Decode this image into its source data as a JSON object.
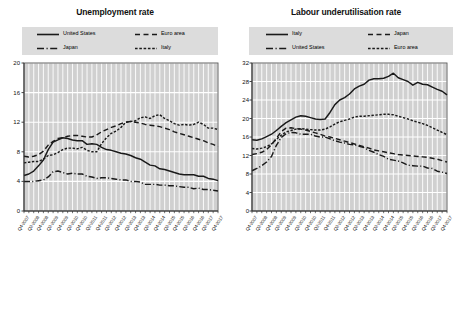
{
  "chart_data": [
    {
      "type": "line",
      "title": "Unemployment rate",
      "xlabel": "",
      "ylabel": "",
      "ylim": [
        0,
        20
      ],
      "yticks": [
        0,
        4,
        8,
        12,
        16,
        20
      ],
      "grid": true,
      "legend_position": "top",
      "x": [
        "Q4-2007",
        "Q2-2008",
        "Q4-2008",
        "Q2-2009",
        "Q4-2009",
        "Q2-2010",
        "Q4-2010",
        "Q2-2011",
        "Q4-2011",
        "Q2-2012",
        "Q4-2012",
        "Q2-2013",
        "Q4-2013",
        "Q2-2014",
        "Q4-2014",
        "Q2-2015",
        "Q4-2015",
        "Q2-2016",
        "Q4-2016",
        "Q2-2017",
        "Q4-2017"
      ],
      "x_all": [
        "Q4-2007",
        "Q1-2008",
        "Q2-2008",
        "Q3-2008",
        "Q4-2008",
        "Q1-2009",
        "Q2-2009",
        "Q3-2009",
        "Q4-2009",
        "Q1-2010",
        "Q2-2010",
        "Q3-2010",
        "Q4-2010",
        "Q1-2011",
        "Q2-2011",
        "Q3-2011",
        "Q4-2011",
        "Q1-2012",
        "Q2-2012",
        "Q3-2012",
        "Q4-2012",
        "Q1-2013",
        "Q2-2013",
        "Q3-2013",
        "Q4-2013",
        "Q1-2014",
        "Q2-2014",
        "Q3-2014",
        "Q4-2014",
        "Q1-2015",
        "Q2-2015",
        "Q3-2015",
        "Q4-2015",
        "Q1-2016",
        "Q2-2016",
        "Q3-2016",
        "Q4-2016",
        "Q1-2017",
        "Q2-2017",
        "Q3-2017",
        "Q4-2017"
      ],
      "series": [
        {
          "name": "United States",
          "style": "solid",
          "values": [
            4.8,
            5.0,
            5.4,
            6.1,
            6.9,
            8.3,
            9.3,
            9.6,
            9.9,
            9.8,
            9.6,
            9.5,
            9.5,
            9.0,
            9.1,
            9.0,
            8.6,
            8.3,
            8.2,
            8.0,
            7.8,
            7.7,
            7.5,
            7.2,
            7.0,
            6.6,
            6.2,
            6.1,
            5.7,
            5.6,
            5.4,
            5.2,
            5.0,
            4.9,
            4.9,
            4.9,
            4.7,
            4.7,
            4.4,
            4.3,
            4.1
          ]
        },
        {
          "name": "Euro area",
          "style": "dashed-long",
          "values": [
            7.4,
            7.3,
            7.4,
            7.6,
            8.1,
            8.9,
            9.4,
            9.8,
            9.9,
            10.1,
            10.2,
            10.2,
            10.1,
            10.0,
            10.0,
            10.3,
            10.7,
            11.0,
            11.3,
            11.5,
            11.8,
            12.0,
            12.1,
            12.0,
            11.9,
            11.7,
            11.6,
            11.5,
            11.4,
            11.2,
            11.0,
            10.7,
            10.5,
            10.3,
            10.1,
            9.9,
            9.7,
            9.5,
            9.2,
            9.0,
            8.7
          ]
        },
        {
          "name": "Japan",
          "style": "dash-dot",
          "values": [
            4.0,
            4.0,
            4.0,
            4.1,
            4.2,
            4.6,
            5.3,
            5.4,
            5.2,
            5.0,
            5.1,
            5.0,
            5.0,
            4.7,
            4.6,
            4.4,
            4.5,
            4.5,
            4.4,
            4.3,
            4.2,
            4.2,
            4.0,
            4.0,
            3.9,
            3.6,
            3.6,
            3.6,
            3.5,
            3.5,
            3.4,
            3.4,
            3.3,
            3.2,
            3.2,
            3.0,
            3.1,
            2.9,
            2.9,
            2.8,
            2.7
          ]
        },
        {
          "name": "Italy",
          "style": "dashed-short",
          "values": [
            6.5,
            6.6,
            6.7,
            6.7,
            7.0,
            7.5,
            7.6,
            7.9,
            8.3,
            8.5,
            8.5,
            8.4,
            8.6,
            8.2,
            8.0,
            8.0,
            9.1,
            9.9,
            10.5,
            10.8,
            11.3,
            12.0,
            12.1,
            12.2,
            12.6,
            12.7,
            12.5,
            12.9,
            13.0,
            12.5,
            12.2,
            11.8,
            11.6,
            11.7,
            11.6,
            11.7,
            12.0,
            11.7,
            11.2,
            11.2,
            11.0
          ]
        }
      ]
    },
    {
      "type": "line",
      "title": "Labour underutilisation rate",
      "xlabel": "",
      "ylabel": "",
      "ylim": [
        0,
        32
      ],
      "yticks": [
        0,
        4,
        8,
        12,
        16,
        20,
        24,
        28,
        32
      ],
      "grid": true,
      "legend_position": "top",
      "x": [
        "Q4-2007",
        "Q2-2008",
        "Q4-2008",
        "Q2-2009",
        "Q4-2009",
        "Q2-2010",
        "Q4-2010",
        "Q2-2011",
        "Q4-2011",
        "Q2-2012",
        "Q4-2012",
        "Q2-2013",
        "Q4-2013",
        "Q2-2014",
        "Q4-2014",
        "Q2-2015",
        "Q4-2015",
        "Q2-2016",
        "Q4-2016",
        "Q2-2017",
        "Q4-2017"
      ],
      "x_all": [
        "Q4-2007",
        "Q1-2008",
        "Q2-2008",
        "Q3-2008",
        "Q4-2008",
        "Q1-2009",
        "Q2-2009",
        "Q3-2009",
        "Q4-2009",
        "Q1-2010",
        "Q2-2010",
        "Q3-2010",
        "Q4-2010",
        "Q1-2011",
        "Q2-2011",
        "Q3-2011",
        "Q4-2011",
        "Q1-2012",
        "Q2-2012",
        "Q3-2012",
        "Q4-2012",
        "Q1-2013",
        "Q2-2013",
        "Q3-2013",
        "Q4-2013",
        "Q1-2014",
        "Q2-2014",
        "Q3-2014",
        "Q4-2014",
        "Q1-2015",
        "Q2-2015",
        "Q3-2015",
        "Q4-2015",
        "Q1-2016",
        "Q2-2016",
        "Q3-2016",
        "Q4-2016",
        "Q1-2017",
        "Q2-2017",
        "Q3-2017",
        "Q4-2017"
      ],
      "series": [
        {
          "name": "Italy",
          "style": "solid",
          "values": [
            15.4,
            15.3,
            15.6,
            16.1,
            16.6,
            17.4,
            18.3,
            19.1,
            19.7,
            20.3,
            20.6,
            20.5,
            20.2,
            19.9,
            19.8,
            19.9,
            21.3,
            23.0,
            24.0,
            24.5,
            25.3,
            26.4,
            27.0,
            27.4,
            28.3,
            28.6,
            28.6,
            28.7,
            29.1,
            29.8,
            28.8,
            28.4,
            28.0,
            27.2,
            27.8,
            27.4,
            27.3,
            26.8,
            26.3,
            25.9,
            25.1
          ]
        },
        {
          "name": "Japan",
          "style": "dashed-long",
          "values": [
            12.2,
            12.4,
            12.7,
            13.3,
            14.3,
            15.7,
            17.2,
            17.9,
            18.0,
            17.8,
            17.7,
            17.5,
            17.2,
            16.9,
            16.6,
            16.2,
            16.0,
            15.7,
            15.4,
            15.1,
            14.8,
            14.5,
            14.2,
            13.9,
            13.6,
            13.2,
            13.0,
            12.8,
            12.6,
            12.4,
            12.2,
            12.1,
            12.0,
            11.9,
            11.8,
            11.7,
            11.6,
            11.4,
            11.2,
            10.9,
            10.6
          ]
        },
        {
          "name": "United States",
          "style": "dash-dot",
          "values": [
            8.7,
            9.2,
            9.8,
            10.6,
            11.8,
            14.2,
            15.9,
            16.7,
            17.0,
            16.9,
            16.6,
            16.6,
            16.6,
            16.2,
            16.0,
            16.0,
            15.6,
            15.2,
            14.9,
            14.7,
            14.4,
            14.3,
            14.0,
            13.7,
            13.1,
            12.7,
            12.2,
            11.8,
            11.2,
            11.0,
            10.8,
            10.4,
            9.9,
            9.8,
            9.7,
            9.7,
            9.3,
            9.2,
            8.6,
            8.4,
            8.1
          ]
        },
        {
          "name": "Euro area",
          "style": "dashed-short",
          "values": [
            13.5,
            13.4,
            13.6,
            13.9,
            14.5,
            15.5,
            16.4,
            17.1,
            17.4,
            17.7,
            17.8,
            17.7,
            17.6,
            17.5,
            17.5,
            17.7,
            18.2,
            18.8,
            19.3,
            19.6,
            19.9,
            20.3,
            20.5,
            20.5,
            20.6,
            20.7,
            20.8,
            20.9,
            20.9,
            20.8,
            20.5,
            20.2,
            19.9,
            19.5,
            19.2,
            18.9,
            18.5,
            18.0,
            17.5,
            17.0,
            16.5
          ]
        }
      ]
    }
  ],
  "panels": [
    {
      "title": "Unemployment rate",
      "legend": [
        {
          "label": "United States",
          "style": "solid"
        },
        {
          "label": "Euro area",
          "style": "dashed-long"
        },
        {
          "label": "Japan",
          "style": "dash-dot"
        },
        {
          "label": "Italy",
          "style": "dashed-short"
        }
      ]
    },
    {
      "title": "Labour underutilisation rate",
      "legend": [
        {
          "label": "Italy",
          "style": "solid"
        },
        {
          "label": "Japan",
          "style": "dashed-long"
        },
        {
          "label": "United States",
          "style": "dash-dot"
        },
        {
          "label": "Euro area",
          "style": "dashed-short"
        }
      ]
    }
  ],
  "colors": {
    "line": "#1a1a1a",
    "plot_background": "#d0d0d0",
    "gridline": "#ffffff",
    "legend_background": "#dcdcdc",
    "axis": "#333333"
  }
}
